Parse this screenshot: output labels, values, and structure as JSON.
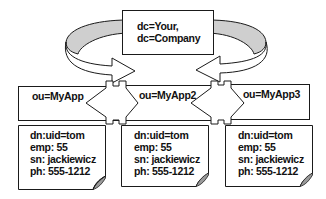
{
  "diagram": {
    "type": "ldap-directory-tree",
    "colors": {
      "background": "#ffffff",
      "stroke": "#1a1a1a",
      "curve_band_fill": "#cfcfcf",
      "page_curl_fill": "#9a9a9a"
    },
    "root": {
      "lines": [
        "dc=Your,",
        "dc=Company"
      ]
    },
    "ous": [
      {
        "label": "ou=MyApp"
      },
      {
        "label": "ou=MyApp2"
      },
      {
        "label": "ou=MyApp3"
      }
    ],
    "entries": [
      {
        "lines": [
          "dn:uid=tom",
          "emp: 55",
          "sn: jackiewicz",
          "ph: 555-1212"
        ]
      },
      {
        "lines": [
          "dn:uid=tom",
          "emp: 55",
          "sn: jackiewicz",
          "ph: 555-1212"
        ]
      },
      {
        "lines": [
          "dn:uid=tom",
          "emp: 55",
          "sn: jackiewicz",
          "ph: 555-1212"
        ]
      }
    ],
    "connectors": [
      {
        "kind": "curved-arrow",
        "from": "root",
        "to": "ou-boundary-left",
        "direction": "right"
      },
      {
        "kind": "curved-arrow",
        "from": "root",
        "to": "ou-boundary-right",
        "direction": "left"
      },
      {
        "kind": "double-arrow",
        "between": [
          "ou=MyApp",
          "ou=MyApp2"
        ]
      },
      {
        "kind": "double-arrow",
        "between": [
          "ou=MyApp2",
          "ou=MyApp3"
        ]
      }
    ]
  }
}
